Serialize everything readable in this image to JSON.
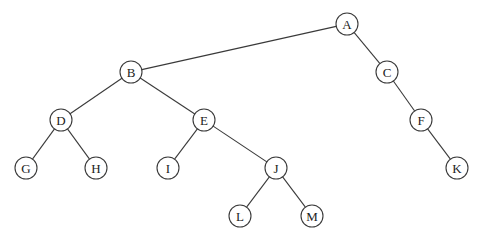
{
  "diagram": {
    "type": "binary-tree",
    "node_radius": 11,
    "nodes": [
      {
        "id": "A",
        "label": "A",
        "x": 347,
        "y": 24
      },
      {
        "id": "B",
        "label": "B",
        "x": 131,
        "y": 72
      },
      {
        "id": "C",
        "label": "C",
        "x": 387,
        "y": 72
      },
      {
        "id": "D",
        "label": "D",
        "x": 61,
        "y": 120
      },
      {
        "id": "E",
        "label": "E",
        "x": 204,
        "y": 120
      },
      {
        "id": "F",
        "label": "F",
        "x": 421,
        "y": 120
      },
      {
        "id": "G",
        "label": "G",
        "x": 26,
        "y": 168
      },
      {
        "id": "H",
        "label": "H",
        "x": 96,
        "y": 168
      },
      {
        "id": "I",
        "label": "I",
        "x": 168,
        "y": 168
      },
      {
        "id": "J",
        "label": "J",
        "x": 276,
        "y": 168
      },
      {
        "id": "K",
        "label": "K",
        "x": 457,
        "y": 168
      },
      {
        "id": "L",
        "label": "L",
        "x": 240,
        "y": 216
      },
      {
        "id": "M",
        "label": "M",
        "x": 312,
        "y": 216
      }
    ],
    "edges": [
      [
        "A",
        "B"
      ],
      [
        "A",
        "C"
      ],
      [
        "B",
        "D"
      ],
      [
        "B",
        "E"
      ],
      [
        "C",
        "F"
      ],
      [
        "D",
        "G"
      ],
      [
        "D",
        "H"
      ],
      [
        "E",
        "I"
      ],
      [
        "E",
        "J"
      ],
      [
        "F",
        "K"
      ],
      [
        "J",
        "L"
      ],
      [
        "J",
        "M"
      ]
    ],
    "colors": {
      "stroke": "#3a3a3a",
      "fill": "#ffffff",
      "text": "#222222"
    }
  }
}
